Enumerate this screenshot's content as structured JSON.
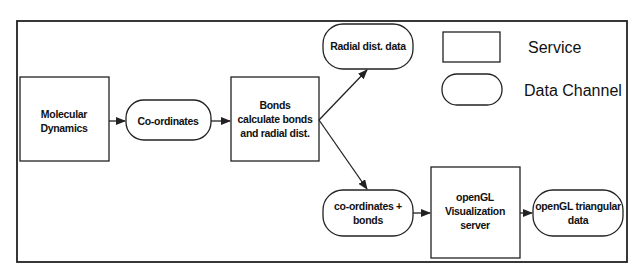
{
  "diagram": {
    "nodes": {
      "molecular_dynamics": {
        "type": "service",
        "lines": [
          "Molecular",
          "Dynamics"
        ]
      },
      "coordinates": {
        "type": "data-channel",
        "lines": [
          "Co-ordinates"
        ]
      },
      "bonds": {
        "type": "service",
        "lines": [
          "Bonds",
          "calculate bonds",
          "and radial dist."
        ]
      },
      "radial_dist_data": {
        "type": "data-channel",
        "lines": [
          "Radial dist. data"
        ]
      },
      "coords_bonds": {
        "type": "data-channel",
        "lines": [
          "co-ordinates +",
          "bonds"
        ]
      },
      "opengl_server": {
        "type": "service",
        "lines": [
          "openGL",
          "Visualization",
          "server"
        ]
      },
      "opengl_data": {
        "type": "data-channel",
        "lines": [
          "openGL triangular",
          "data"
        ]
      }
    },
    "edges": [
      {
        "from": "molecular_dynamics",
        "to": "coordinates"
      },
      {
        "from": "coordinates",
        "to": "bonds"
      },
      {
        "from": "bonds",
        "to": "radial_dist_data"
      },
      {
        "from": "bonds",
        "to": "coords_bonds"
      },
      {
        "from": "coords_bonds",
        "to": "opengl_server"
      },
      {
        "from": "opengl_server",
        "to": "opengl_data"
      }
    ],
    "legend": {
      "service_label": "Service",
      "data_channel_label": "Data Channel"
    }
  }
}
